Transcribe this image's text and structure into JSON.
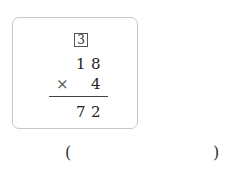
{
  "problem": {
    "number": "3",
    "multiplicand": [
      "1",
      "8"
    ],
    "operator": "×",
    "multiplier": "4",
    "product": [
      "7",
      "2"
    ]
  },
  "answer": {
    "open_paren": "(",
    "close_paren": ")",
    "value": ""
  }
}
